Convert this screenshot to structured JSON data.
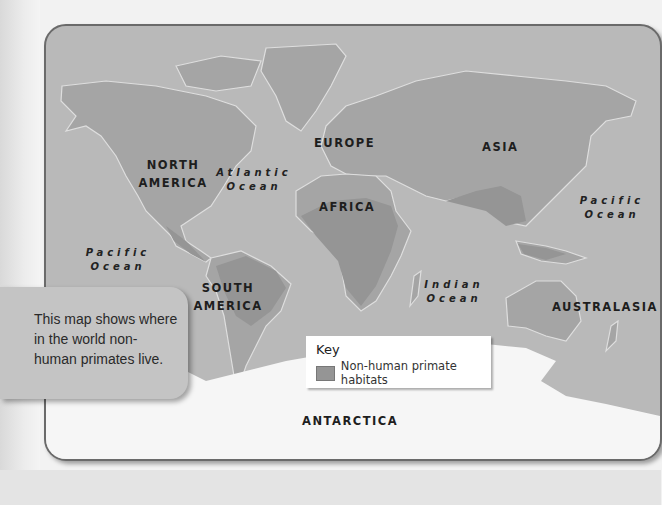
{
  "map": {
    "caption": "This map shows where in the world non-human primates live.",
    "continents": {
      "north_america": "NORTH AMERICA",
      "south_america": "SOUTH AMERICA",
      "europe": "EUROPE",
      "africa": "AFRICA",
      "asia": "ASIA",
      "australasia": "AUSTRALASIA",
      "antarctica": "ANTARCTICA"
    },
    "oceans": {
      "atlantic": "Atlantic Ocean",
      "pacific_west": "Pacific Ocean",
      "pacific_east": "Pacific Ocean",
      "indian": "Indian Ocean"
    },
    "key": {
      "title": "Key",
      "items": [
        {
          "label": "Non-human primate habitats",
          "color": "#959595"
        }
      ]
    },
    "colors": {
      "ocean": "#b9b9b9",
      "land": "#a5a5a5",
      "habitat": "#959595",
      "antarctica": "#f6f6f6",
      "coast": "#dedede"
    }
  }
}
